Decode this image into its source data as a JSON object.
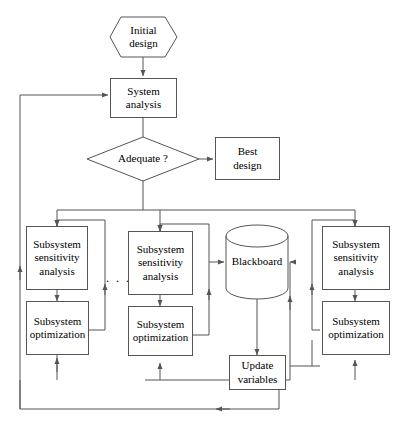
{
  "diagram": {
    "background_color": "#ffffff",
    "line_color": "#555555",
    "text_color": "#000000",
    "ellipsis": ". . ."
  },
  "nodes": {
    "initial_design": {
      "label": "Initial\ndesign",
      "line1": "Initial",
      "line2": "design",
      "shape": "hexagon"
    },
    "system_analysis": {
      "label": "System\nanalysis",
      "line1": "System",
      "line2": "analysis",
      "shape": "rectangle"
    },
    "adequate": {
      "label": "Adequate ?",
      "shape": "diamond"
    },
    "best_design": {
      "label": "Best\ndesign",
      "line1": "Best",
      "line2": "design",
      "shape": "rectangle"
    },
    "blackboard": {
      "label": "Blackboard",
      "shape": "cylinder"
    },
    "update_variables": {
      "label": "Update\nvariables",
      "line1": "Update",
      "line2": "variables",
      "shape": "rectangle"
    },
    "subsystem_left": {
      "sensitivity": {
        "line1": "Subsystem",
        "line2": "sensitivity",
        "line3": "analysis",
        "shape": "rectangle"
      },
      "optimization": {
        "line1": "Subsystem",
        "line2": "optimization",
        "shape": "rectangle"
      }
    },
    "subsystem_middle": {
      "sensitivity": {
        "line1": "Subsystem",
        "line2": "sensitivity",
        "line3": "analysis",
        "shape": "rectangle"
      },
      "optimization": {
        "line1": "Subsystem",
        "line2": "optimization",
        "shape": "rectangle"
      }
    },
    "subsystem_right": {
      "sensitivity": {
        "line1": "Subsystem",
        "line2": "sensitivity",
        "line3": "analysis",
        "shape": "rectangle"
      },
      "optimization": {
        "line1": "Subsystem",
        "line2": "optimization",
        "shape": "rectangle"
      }
    }
  }
}
